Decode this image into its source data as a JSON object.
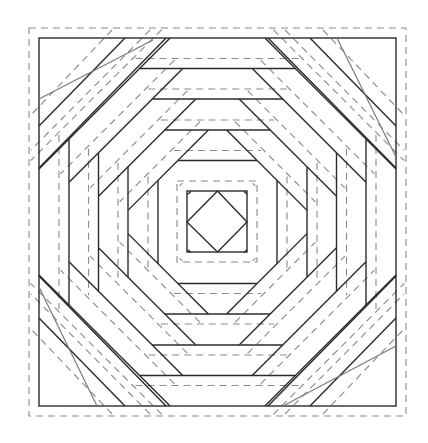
{
  "diagram": {
    "title": "Pineapple log-cabin quilt block pattern",
    "colors": {
      "background": "#ffffff",
      "piece_line": "#2b2b2b",
      "seam_allowance_line": "#8a8a8a",
      "corner_guide_line": "#7a7a7a"
    },
    "block": {
      "seam_outline": {
        "x": 29,
        "y": 28,
        "w": 377,
        "h": 388
      },
      "finished_outline": {
        "x": 39,
        "y": 38,
        "w": 357,
        "h": 368
      },
      "center": {
        "x": 217.5,
        "y": 222
      }
    },
    "center_square": {
      "x": 187,
      "y": 191,
      "w": 60,
      "h": 61
    },
    "rings": {
      "left_verticals": [
        188,
        158,
        128,
        99,
        69
      ],
      "right_verticals": [
        247,
        277,
        307,
        337,
        366
      ],
      "top_horizontals": [
        191,
        160,
        130,
        99,
        68
      ],
      "bottom_horizontals": [
        252,
        283,
        314,
        345,
        375
      ]
    },
    "corner_guides": [
      {
        "x1": 39,
        "y1": 99,
        "x2": 153,
        "y2": 40
      },
      {
        "x1": 337,
        "y1": 38,
        "x2": 396,
        "y2": 157
      },
      {
        "x1": 39,
        "y1": 287,
        "x2": 97,
        "y2": 406
      },
      {
        "x1": 396,
        "y1": 346,
        "x2": 283,
        "y2": 406
      }
    ]
  }
}
